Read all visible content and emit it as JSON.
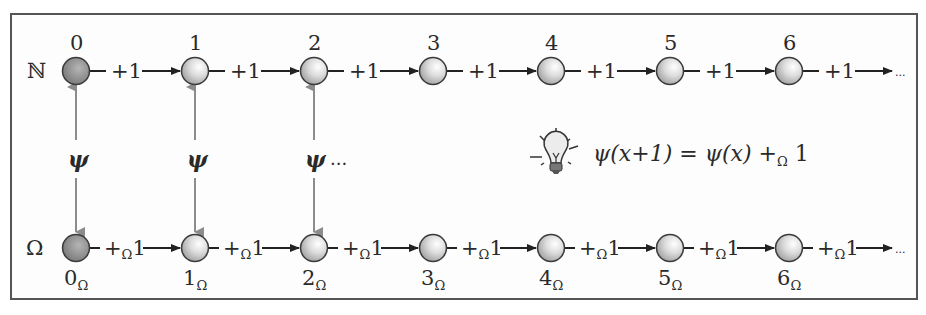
{
  "diagram": {
    "top_row": {
      "set_label": "ℕ",
      "nodes": [
        "0",
        "1",
        "2",
        "3",
        "4",
        "5",
        "6"
      ],
      "edge_label": "+1",
      "continuation": "..."
    },
    "bottom_row": {
      "set_label": "Ω",
      "nodes": [
        {
          "base": "0",
          "sub": "Ω"
        },
        {
          "base": "1",
          "sub": "Ω"
        },
        {
          "base": "2",
          "sub": "Ω"
        },
        {
          "base": "3",
          "sub": "Ω"
        },
        {
          "base": "4",
          "sub": "Ω"
        },
        {
          "base": "5",
          "sub": "Ω"
        },
        {
          "base": "6",
          "sub": "Ω"
        }
      ],
      "edge_label": {
        "plus": "+",
        "sub": "Ω",
        "one": "1"
      },
      "continuation": "..."
    },
    "mapping": {
      "symbol": "ψ",
      "continuation": "...",
      "mapped_nodes": [
        0,
        1,
        2
      ]
    },
    "insight": {
      "icon": "lightbulb-icon",
      "equation": {
        "lhs": "ψ(x+1)",
        "eq": "=",
        "rhs_base": "ψ(x)",
        "rhs_op": "+",
        "rhs_op_sub": "Ω",
        "rhs_one": "1"
      }
    },
    "colors": {
      "frame": "#555555",
      "node_dark": "#8a8a8a",
      "node_light": "#d9d9d9",
      "mapping_arrow": "#8c8c8c",
      "text": "#2a2a2a"
    }
  }
}
